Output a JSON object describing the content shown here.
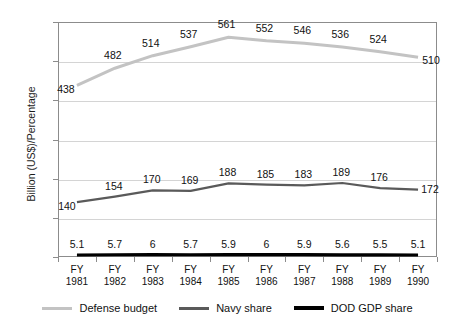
{
  "chart_data": {
    "type": "line",
    "title": "",
    "xlabel": "",
    "ylabel": "Billion (US$)/Percentage",
    "ylim": [
      0,
      600
    ],
    "yticks": [
      0,
      100,
      200,
      300,
      400,
      500,
      600
    ],
    "grid": true,
    "legend_position": "bottom",
    "categories": [
      "FY 1981",
      "FY 1982",
      "FY 1983",
      "FY 1984",
      "FY 1985",
      "FY 1986",
      "FY 1987",
      "FY 1988",
      "FY 1989",
      "FY 1990"
    ],
    "category_lines": [
      {
        "fy": "FY",
        "year": "1981"
      },
      {
        "fy": "FY",
        "year": "1982"
      },
      {
        "fy": "FY",
        "year": "1983"
      },
      {
        "fy": "FY",
        "year": "1984"
      },
      {
        "fy": "FY",
        "year": "1985"
      },
      {
        "fy": "FY",
        "year": "1986"
      },
      {
        "fy": "FY",
        "year": "1987"
      },
      {
        "fy": "FY",
        "year": "1988"
      },
      {
        "fy": "FY",
        "year": "1989"
      },
      {
        "fy": "FY",
        "year": "1990"
      }
    ],
    "series": [
      {
        "name": "Defense budget",
        "color": "#c3c3c3",
        "values": [
          438,
          482,
          514,
          537,
          561,
          552,
          546,
          536,
          524,
          510
        ],
        "labels": [
          "438",
          "482",
          "514",
          "537",
          "561",
          "552",
          "546",
          "536",
          "524",
          "510"
        ]
      },
      {
        "name": "Navy share",
        "color": "#5a5a5a",
        "values": [
          140,
          154,
          170,
          169,
          188,
          185,
          183,
          189,
          176,
          172
        ],
        "labels": [
          "140",
          "154",
          "170",
          "169",
          "188",
          "185",
          "183",
          "189",
          "176",
          "172"
        ]
      },
      {
        "name": "DOD GDP share",
        "color": "#000000",
        "values": [
          5.1,
          5.7,
          6,
          5.7,
          5.9,
          6,
          5.9,
          5.6,
          5.5,
          5.1
        ],
        "labels": [
          "5.1",
          "5.7",
          "6",
          "5.7",
          "5.9",
          "6",
          "5.9",
          "5.6",
          "5.5",
          "5.1"
        ]
      }
    ],
    "ytick_labels": [
      "600",
      "500",
      "400",
      "300",
      "200",
      "100",
      "0"
    ],
    "legend": [
      {
        "label": "Defense budget",
        "color": "#c3c3c3"
      },
      {
        "label": "Navy share",
        "color": "#5a5a5a"
      },
      {
        "label": "DOD GDP share",
        "color": "#000000"
      }
    ]
  }
}
